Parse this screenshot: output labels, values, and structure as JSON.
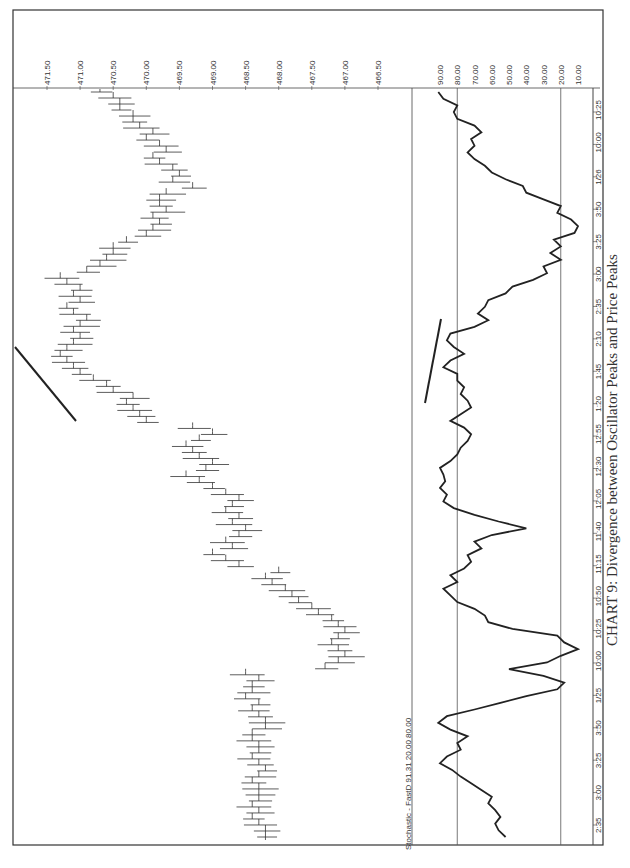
{
  "caption": "CHART 9: Divergence between Oscillator Peaks and Price Peaks",
  "chart_data": [
    {
      "type": "ohlc",
      "title": "Price bars",
      "orientation": "rotated 90° clockwise on page",
      "ylabel": "Price",
      "y_ticks": [
        "471.50",
        "471.00",
        "470.50",
        "470.00",
        "469.50",
        "469.00",
        "468.50",
        "468.00",
        "467.50",
        "467.00",
        "466.50"
      ],
      "ylim": [
        466.3,
        471.6
      ],
      "x_ticks": [
        "2:35",
        "3:00",
        "3:25",
        "3:50",
        "1/25",
        "10:00",
        "10:25",
        "10:50",
        "11:15",
        "11:40",
        "12:05",
        "12:30",
        "12:55",
        "1:20",
        "1:45",
        "2:10",
        "2:35",
        "3:00",
        "3:25",
        "3:50",
        "1/26",
        "10:00",
        "10:25"
      ],
      "annotation": "Trendline connecting rising price peaks (approx. 1:20 to 2:10)",
      "approx_close": [
        468.2,
        468.2,
        468.3,
        468.4,
        468.3,
        468.4,
        468.3,
        468.3,
        468.3,
        468.4,
        468.3,
        468.2,
        468.3,
        468.4,
        468.3,
        468.3,
        468.4,
        468.4,
        468.2,
        468.2,
        468.3,
        468.4,
        468.3,
        468.5,
        468.4,
        468.4,
        468.3,
        468.5,
        467.3,
        467.1,
        467.0,
        467.1,
        467.2,
        467.1,
        467.0,
        467.1,
        467.2,
        467.4,
        467.5,
        467.7,
        467.8,
        467.9,
        468.1,
        468.2,
        468.0,
        468.6,
        468.8,
        469.0,
        468.7,
        468.8,
        468.6,
        468.5,
        468.7,
        468.6,
        468.8,
        468.7,
        468.6,
        468.8,
        469.0,
        469.2,
        469.4,
        469.1,
        469.0,
        469.2,
        469.3,
        469.4,
        469.2,
        469.0,
        469.3,
        470.0,
        470.1,
        470.2,
        470.3,
        470.2,
        470.5,
        470.6,
        470.8,
        471.0,
        471.1,
        471.2,
        471.3,
        471.2,
        471.1,
        471.0,
        471.1,
        471.0,
        470.9,
        471.1,
        471.2,
        471.0,
        471.1,
        471.0,
        471.2,
        471.3,
        470.9,
        470.7,
        470.6,
        470.5,
        470.5,
        470.3,
        470.0,
        469.9,
        469.8,
        469.9,
        469.7,
        469.8,
        469.8,
        469.7,
        469.3,
        469.6,
        469.5,
        469.6,
        469.8,
        469.9,
        469.7,
        469.8,
        470.0,
        469.9,
        470.1,
        470.2,
        470.2,
        470.4,
        470.4,
        470.5,
        470.7
      ]
    },
    {
      "type": "line",
      "title": "Stochastic - FastD",
      "legend": "Stochastic - FastD  91.31  20.00  80.00",
      "last_value": 91.31,
      "reference_lines": [
        20.0,
        80.0
      ],
      "ylabel": "",
      "y_ticks": [
        "90.00",
        "80.00",
        "70.00",
        "60.00",
        "50.00",
        "40.00",
        "30.00",
        "20.00",
        "10.00"
      ],
      "ylim": [
        0,
        100
      ],
      "x_ticks": [
        "2:35",
        "3:00",
        "3:25",
        "3:50",
        "1/25",
        "10:00",
        "10:25",
        "10:50",
        "11:15",
        "11:40",
        "12:05",
        "12:30",
        "12:55",
        "1:20",
        "1:45",
        "2:10",
        "2:35",
        "3:00",
        "3:25",
        "3:50",
        "1/26",
        "10:00",
        "10:25"
      ],
      "annotation": "Trendline connecting falling oscillator peaks (approx. 1:20 to 2:10) — bearish divergence",
      "values": [
        52,
        56,
        58,
        55,
        58,
        62,
        60,
        66,
        72,
        78,
        83,
        90,
        86,
        78,
        80,
        74,
        84,
        91,
        86,
        70,
        55,
        40,
        22,
        18,
        30,
        50,
        28,
        20,
        10,
        18,
        22,
        48,
        62,
        64,
        70,
        80,
        84,
        88,
        80,
        84,
        76,
        72,
        74,
        66,
        70,
        60,
        40,
        56,
        70,
        82,
        88,
        86,
        90,
        87,
        88,
        90,
        84,
        80,
        78,
        74,
        72,
        76,
        84,
        78,
        72,
        74,
        78,
        76,
        80,
        80,
        88,
        84,
        76,
        82,
        86,
        84,
        70,
        62,
        68,
        64,
        62,
        52,
        48,
        36,
        28,
        30,
        20,
        26,
        20,
        24,
        12,
        10,
        14,
        22,
        20,
        30,
        40,
        42,
        52,
        60,
        64,
        70,
        74,
        70,
        72,
        66,
        70,
        80,
        82,
        80,
        88,
        91
      ]
    }
  ]
}
